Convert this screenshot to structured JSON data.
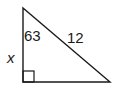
{
  "diagram": {
    "type": "right-triangle",
    "stroke_color": "#1a1a1a",
    "background": "#ffffff",
    "vertices": {
      "top": [
        23,
        8
      ],
      "right_angle": [
        23,
        82
      ],
      "right": [
        110,
        82
      ]
    },
    "labels": {
      "angle": "63",
      "hypotenuse": "12",
      "vertical_leg": "x"
    },
    "right_angle_marker": true
  }
}
